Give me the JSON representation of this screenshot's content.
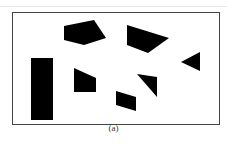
{
  "figure": {
    "caption": "(a)",
    "frame": {
      "x": 12,
      "y": 12,
      "width": 207,
      "height": 112,
      "stroke": "#444444"
    },
    "fill_color": "#000000",
    "obstacles": [
      {
        "name": "rectangle-obstacle",
        "points": "31,58 53,58 53,120 31,120"
      },
      {
        "name": "pentagon-obstacle",
        "points": "64,26 94,20 106,38 84,45 64,40"
      },
      {
        "name": "quad-obstacle-top",
        "points": "127,25 169,38 148,53 127,45"
      },
      {
        "name": "triangle-obstacle-right",
        "points": "181,62 200,52 200,71"
      },
      {
        "name": "trapezoid-obstacle",
        "points": "74,68 96,78 96,92 74,92"
      },
      {
        "name": "triangle-obstacle-center",
        "points": "137,74 157,77 157,97"
      },
      {
        "name": "parallelogram-obstacle",
        "points": "116,91 136,97 136,111 116,105"
      }
    ]
  }
}
